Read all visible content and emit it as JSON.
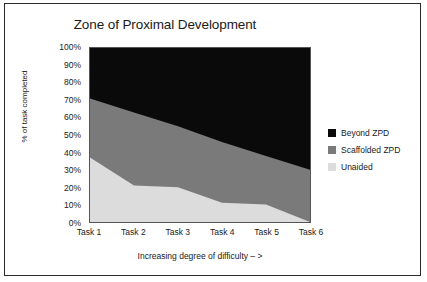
{
  "figure": {
    "border_color": "#2b2b2b",
    "background": "#ffffff"
  },
  "chart_data": {
    "type": "area",
    "stacked": true,
    "title": "Zone of Proximal Development",
    "xlabel": "Increasing degree of difficulty – >",
    "ylabel": "% of task completed",
    "categories": [
      "Task 1",
      "Task 2",
      "Task 3",
      "Task 4",
      "Task 5",
      "Task 6"
    ],
    "ylim": [
      0,
      100
    ],
    "ytick_labels": [
      "0%",
      "10%",
      "20%",
      "30%",
      "40%",
      "50%",
      "60%",
      "70%",
      "80%",
      "90%",
      "100%"
    ],
    "ytick_values": [
      0,
      10,
      20,
      30,
      40,
      50,
      60,
      70,
      80,
      90,
      100
    ],
    "grid": false,
    "legend_position": "right",
    "series": [
      {
        "name": "Unaided",
        "color": "#dcdcdc",
        "values": [
          37,
          21,
          20,
          11,
          10,
          0
        ],
        "cumulative_top": [
          37,
          21,
          20,
          11,
          10,
          0
        ]
      },
      {
        "name": "Scaffolded ZPD",
        "color": "#7a7a7a",
        "values": [
          34,
          42,
          35,
          35,
          28,
          30
        ],
        "cumulative_top": [
          71,
          63,
          55,
          46,
          38,
          30
        ]
      },
      {
        "name": "Beyond ZPD",
        "color": "#0a0a0a",
        "values": [
          29,
          37,
          45,
          54,
          62,
          70
        ],
        "cumulative_top": [
          100,
          100,
          100,
          100,
          100,
          100
        ]
      }
    ],
    "legend_order": [
      "Beyond ZPD",
      "Scaffolded ZPD",
      "Unaided"
    ]
  }
}
